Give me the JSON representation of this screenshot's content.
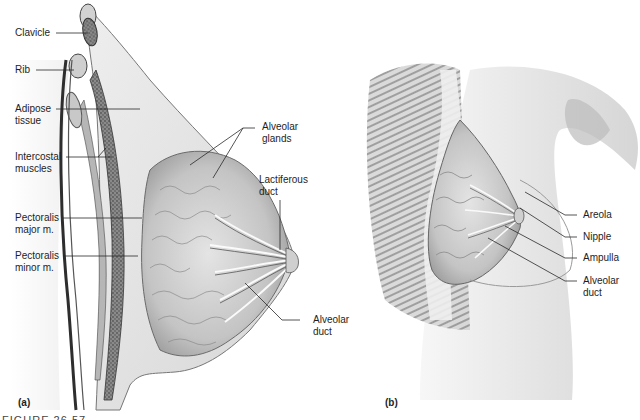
{
  "figure": {
    "panel_a": {
      "tag": "(a)",
      "labels": {
        "clavicle": "Clavicle",
        "rib": "Rib",
        "adipose": "Adipose\ntissue",
        "intercostal": "Intercostal\nmuscles",
        "pect_major": "Pectoralis\nmajor m.",
        "pect_minor": "Pectoralis\nminor m.",
        "alveolar_glands": "Alveolar\nglands",
        "lactiferous_duct": "Lactiferous\nduct",
        "alveolar_duct": "Alveolar\nduct"
      }
    },
    "panel_b": {
      "tag": "(b)",
      "labels": {
        "areola": "Areola",
        "nipple": "Nipple",
        "ampulla": "Ampulla",
        "alveolar_duct": "Alveolar\nduct"
      }
    },
    "caption": "FIGURE 26.57"
  },
  "colors": {
    "label_text": "#1e1e1e",
    "leader_line": "#2a2a2a",
    "tissue_light": "#e6e6e6",
    "tissue_mid": "#b8b8b8",
    "tissue_dark": "#6e6e6e",
    "bone_dark": "#2e2e2e"
  }
}
